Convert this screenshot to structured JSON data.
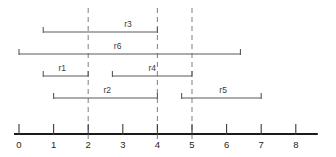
{
  "chart_data": {
    "type": "table",
    "title": "",
    "subtitle": "",
    "xlabel": "",
    "ylabel": "",
    "grid": true,
    "legend_position": "none",
    "axis": {
      "orientation": "horizontal",
      "min": 0,
      "max": 8,
      "tick_step": 1,
      "tick_labels": [
        "0",
        "1",
        "2",
        "3",
        "4",
        "5",
        "6",
        "7",
        "8"
      ],
      "tick_values": [
        0,
        1,
        2,
        3,
        4,
        5,
        6,
        7,
        8
      ]
    },
    "dashed_gridlines": {
      "values": [
        2,
        4,
        5
      ],
      "style": "dashed",
      "color": "#8a8a8a"
    },
    "intervals": [
      {
        "name": "r3",
        "start": 0.7,
        "end": 4.0,
        "row": 0,
        "label": "r3",
        "label_at": 3.15
      },
      {
        "name": "r6",
        "start": 0.0,
        "end": 6.4,
        "row": 1,
        "label": "r6",
        "label_at": 2.85
      },
      {
        "name": "r1",
        "start": 0.7,
        "end": 2.0,
        "row": 2,
        "label": "r1",
        "label_at": 1.25
      },
      {
        "name": "r4",
        "start": 2.7,
        "end": 5.0,
        "row": 2,
        "label": "r4",
        "label_at": 3.85
      },
      {
        "name": "r2",
        "start": 1.0,
        "end": 4.0,
        "row": 3,
        "label": "r2",
        "label_at": 2.55
      },
      {
        "name": "r5",
        "start": 4.7,
        "end": 7.0,
        "row": 3,
        "label": "r5",
        "label_at": 5.9
      }
    ],
    "series": [
      {
        "name": "r1",
        "values": [
          0.7,
          2.0
        ]
      },
      {
        "name": "r2",
        "values": [
          1.0,
          4.0
        ]
      },
      {
        "name": "r3",
        "values": [
          0.7,
          4.0
        ]
      },
      {
        "name": "r4",
        "values": [
          2.7,
          5.0
        ]
      },
      {
        "name": "r5",
        "values": [
          4.7,
          7.0
        ]
      },
      {
        "name": "r6",
        "values": [
          0.0,
          6.4
        ]
      }
    ],
    "colors": {
      "axis": "#1a1a1a",
      "interval": "#5a5a5a",
      "gridline": "#8a8a8a",
      "background": "#ffffff",
      "text": "#1f1f1f"
    }
  }
}
